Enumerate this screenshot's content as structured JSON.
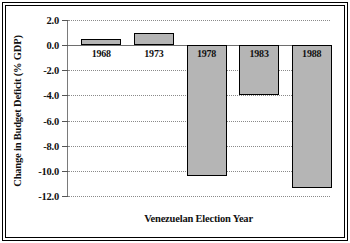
{
  "chart_data": {
    "type": "bar",
    "title": "",
    "xlabel": "Venezuelan Election Year",
    "ylabel": "Change in Budget Deficit (% GDP)",
    "categories": [
      "1968",
      "1973",
      "1978",
      "1983",
      "1988"
    ],
    "values": [
      0.5,
      1.0,
      -10.4,
      -4.0,
      -11.4
    ],
    "ylim": [
      -12.0,
      2.0
    ],
    "yticks": [
      "2.0",
      "0.0",
      "-2.0",
      "-4.0",
      "-6.0",
      "-8.0",
      "-10.0",
      "-12.0"
    ],
    "ytick_values": [
      2.0,
      0.0,
      -2.0,
      -4.0,
      -6.0,
      -8.0,
      -10.0,
      -12.0
    ],
    "grid": true,
    "legend": "none",
    "bar_fill_color": "#b5b5b5",
    "bar_edge_color": "#000000",
    "gridline_color": "#8a8a8a",
    "background_color": "#ffffff"
  }
}
